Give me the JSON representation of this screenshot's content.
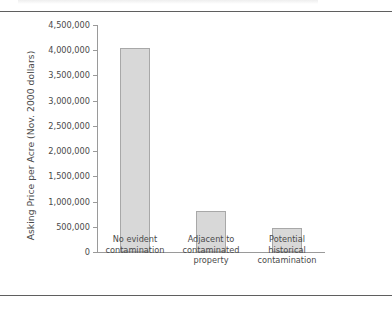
{
  "figure": {
    "background": "#ffffff",
    "rule_color": "#5f5f5f",
    "axis_color": "#9a9a9a",
    "bar_fill": "#d8d8d8",
    "bar_stroke": "#a8a8a8",
    "text_color": "#4a4a4a"
  },
  "chart_data": {
    "type": "bar",
    "title": "",
    "xlabel": "",
    "ylabel": "Asking Price per Acre (Nov. 2000 dollars)",
    "categories": [
      "No evident contamination",
      "Adjacent to contaminated property",
      "Potential historical contamination"
    ],
    "category_lines": [
      [
        "No evident",
        "contamination"
      ],
      [
        "Adjacent to",
        "contaminated",
        "property"
      ],
      [
        "Potential",
        "historical",
        "contamination"
      ]
    ],
    "values": [
      4050000,
      810000,
      475000
    ],
    "ylim": [
      0,
      4500000
    ],
    "yticks": [
      0,
      500000,
      1000000,
      1500000,
      2000000,
      2500000,
      3000000,
      3500000,
      4000000,
      4500000
    ],
    "ytick_labels": [
      "0",
      "500,000",
      "1,000,000",
      "1,500,000",
      "2,000,000",
      "2,500,000",
      "3,000,000",
      "3,500,000",
      "4,000,000",
      "4,500,000"
    ],
    "grid": false,
    "legend": null,
    "legend_position": "none",
    "series": [
      {
        "name": "Asking Price per Acre",
        "values": [
          4050000,
          810000,
          475000
        ]
      }
    ]
  }
}
